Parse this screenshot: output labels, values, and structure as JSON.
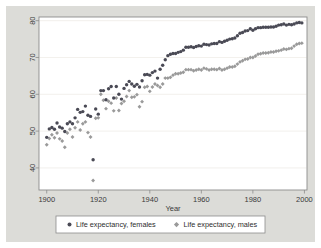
{
  "chart_data": {
    "type": "scatter",
    "title": "",
    "subtitle": "",
    "xlabel": "Year",
    "ylabel": "",
    "xlim": [
      1897,
      2001
    ],
    "ylim": [
      34,
      81
    ],
    "xticks": [
      1900,
      1920,
      1940,
      1960,
      1980,
      2000
    ],
    "yticks": [
      40,
      50,
      60,
      70,
      80
    ],
    "xtick_labels": [
      "1900",
      "1920",
      "1940",
      "1960",
      "1980",
      "2000"
    ],
    "ytick_labels": [
      "40",
      "50",
      "60",
      "70",
      "80"
    ],
    "grid": "horizontal",
    "grid_color": "#eceae4",
    "panel_color": "#ffffff",
    "background_color": "#dcdcd8",
    "legend_position": "bottom",
    "y_axis_label_rotation": -90,
    "series": [
      {
        "name": "Life expectancy, females",
        "marker": "circle",
        "color": "#4a4a55",
        "x": [
          1900,
          1901,
          1902,
          1903,
          1904,
          1905,
          1906,
          1907,
          1908,
          1909,
          1910,
          1911,
          1912,
          1913,
          1914,
          1915,
          1916,
          1917,
          1918,
          1919,
          1920,
          1921,
          1922,
          1923,
          1924,
          1925,
          1926,
          1927,
          1928,
          1929,
          1930,
          1931,
          1932,
          1933,
          1934,
          1935,
          1936,
          1937,
          1938,
          1939,
          1940,
          1941,
          1942,
          1943,
          1944,
          1945,
          1946,
          1947,
          1948,
          1949,
          1950,
          1951,
          1952,
          1953,
          1954,
          1955,
          1956,
          1957,
          1958,
          1959,
          1960,
          1961,
          1962,
          1963,
          1964,
          1965,
          1966,
          1967,
          1968,
          1969,
          1970,
          1971,
          1972,
          1973,
          1974,
          1975,
          1976,
          1977,
          1978,
          1979,
          1980,
          1981,
          1982,
          1983,
          1984,
          1985,
          1986,
          1987,
          1988,
          1989,
          1990,
          1991,
          1992,
          1993,
          1994,
          1995,
          1996,
          1997,
          1998,
          1999
        ],
        "y": [
          48.3,
          50.6,
          51.0,
          50.5,
          52.2,
          51.1,
          50.8,
          49.9,
          52.0,
          52.5,
          52.0,
          53.6,
          55.9,
          55.1,
          55.3,
          56.8,
          54.3,
          54.0,
          42.2,
          56.0,
          54.6,
          61.0,
          61.0,
          58.5,
          61.5,
          62.1,
          59.0,
          62.1,
          60.0,
          58.7,
          61.6,
          62.6,
          63.5,
          62.8,
          62.2,
          62.7,
          62.0,
          63.7,
          65.3,
          65.4,
          65.2,
          65.9,
          66.3,
          64.4,
          66.8,
          67.9,
          69.4,
          70.5,
          70.9,
          71.1,
          71.1,
          71.4,
          71.6,
          72.0,
          72.8,
          72.8,
          72.9,
          72.7,
          73.0,
          73.2,
          73.1,
          73.6,
          73.5,
          73.4,
          73.7,
          73.8,
          73.8,
          74.3,
          74.1,
          74.4,
          74.7,
          75.0,
          75.1,
          75.3,
          75.9,
          76.6,
          76.8,
          77.2,
          77.3,
          77.8,
          77.4,
          77.8,
          78.1,
          78.1,
          78.2,
          78.2,
          78.2,
          78.3,
          78.3,
          78.5,
          78.8,
          78.9,
          79.1,
          78.8,
          79.0,
          78.9,
          79.1,
          79.4,
          79.5,
          79.4
        ]
      },
      {
        "name": "Life expectancy, males",
        "marker": "diamond",
        "color": "#9a9a9a",
        "x": [
          1900,
          1901,
          1902,
          1903,
          1904,
          1905,
          1906,
          1907,
          1908,
          1909,
          1910,
          1911,
          1912,
          1913,
          1914,
          1915,
          1916,
          1917,
          1918,
          1919,
          1920,
          1921,
          1922,
          1923,
          1924,
          1925,
          1926,
          1927,
          1928,
          1929,
          1930,
          1931,
          1932,
          1933,
          1934,
          1935,
          1936,
          1937,
          1938,
          1939,
          1940,
          1941,
          1942,
          1943,
          1944,
          1945,
          1946,
          1947,
          1948,
          1949,
          1950,
          1951,
          1952,
          1953,
          1954,
          1955,
          1956,
          1957,
          1958,
          1959,
          1960,
          1961,
          1962,
          1963,
          1964,
          1965,
          1966,
          1967,
          1968,
          1969,
          1970,
          1971,
          1972,
          1973,
          1974,
          1975,
          1976,
          1977,
          1978,
          1979,
          1980,
          1981,
          1982,
          1983,
          1984,
          1985,
          1986,
          1987,
          1988,
          1989,
          1990,
          1991,
          1992,
          1993,
          1994,
          1995,
          1996,
          1997,
          1998,
          1999
        ],
        "y": [
          46.3,
          48.0,
          49.0,
          48.2,
          49.5,
          47.9,
          47.3,
          45.6,
          49.5,
          50.5,
          48.4,
          50.9,
          52.5,
          50.3,
          52.0,
          52.5,
          49.6,
          48.4,
          36.6,
          53.5,
          53.6,
          60.0,
          58.4,
          56.1,
          58.1,
          57.6,
          55.5,
          59.0,
          55.6,
          57.5,
          58.1,
          59.4,
          61.0,
          59.2,
          59.3,
          59.9,
          56.6,
          58.0,
          61.9,
          62.1,
          60.8,
          62.0,
          62.8,
          62.4,
          61.9,
          62.8,
          64.4,
          64.4,
          64.6,
          65.2,
          65.6,
          65.6,
          65.8,
          66.0,
          66.7,
          66.7,
          66.7,
          66.4,
          66.6,
          66.8,
          66.6,
          67.1,
          66.9,
          66.6,
          66.8,
          66.8,
          66.7,
          67.0,
          66.6,
          66.8,
          67.1,
          67.4,
          67.4,
          67.6,
          68.2,
          68.8,
          69.1,
          69.5,
          69.6,
          70.0,
          70.0,
          70.4,
          70.9,
          71.0,
          71.2,
          71.2,
          71.3,
          71.5,
          71.5,
          71.7,
          71.8,
          72.0,
          72.3,
          72.2,
          72.4,
          72.5,
          73.1,
          73.6,
          73.8,
          73.9
        ]
      }
    ]
  },
  "legend": {
    "entries": [
      {
        "label": "Life expectancy, females",
        "marker": "circle-marker",
        "color": "#4a4a55"
      },
      {
        "label": "Life expectancy, males",
        "marker": "diamond-marker",
        "color": "#9a9a9a"
      }
    ]
  },
  "axes": {
    "x_title": "Year"
  }
}
